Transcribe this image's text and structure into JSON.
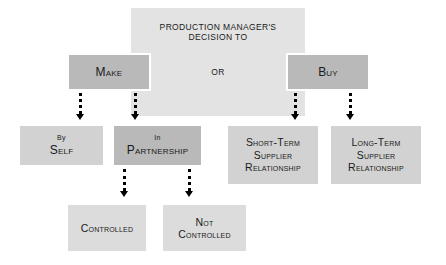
{
  "diagram": {
    "title_lines": [
      "PRODUCTION MANAGER'S",
      "DECISION TO"
    ],
    "connector_label": "OR",
    "colors": {
      "background": "#ffffff",
      "header_box": "#e3e3e3",
      "decision_box": "#b9b9b9",
      "option_box": "#d2d2d2",
      "outcome_box": "#dcdcdc",
      "text": "#1a1a1a",
      "arrow": "#000000",
      "box_outline": "#ffffff"
    },
    "nodes": {
      "header": {
        "line1": "PRODUCTION MANAGER'S",
        "line2": "DECISION TO"
      },
      "make": {
        "label": "Make"
      },
      "buy": {
        "label": "Buy"
      },
      "by_self": {
        "line1": "By",
        "line2": "Self"
      },
      "in_partnership": {
        "line1": "In",
        "line2": "Partnership"
      },
      "short_term": {
        "line1": "Short-Term",
        "line2": "Supplier",
        "line3": "Relationship"
      },
      "long_term": {
        "line1": "Long-Term",
        "line2": "Supplier",
        "line3": "Relationship"
      },
      "controlled": {
        "label": "Controlled"
      },
      "not_controlled": {
        "line1": "Not",
        "line2": "Controlled"
      }
    },
    "arrows": [
      {
        "name": "make-to-by-self",
        "from": "make",
        "to": "by_self"
      },
      {
        "name": "make-to-in-partnership",
        "from": "make",
        "to": "in_partnership"
      },
      {
        "name": "buy-to-short-term",
        "from": "buy",
        "to": "short_term"
      },
      {
        "name": "buy-to-long-term",
        "from": "buy",
        "to": "long_term"
      },
      {
        "name": "in-partnership-to-controlled",
        "from": "in_partnership",
        "to": "controlled"
      },
      {
        "name": "in-partnership-to-not-controlled",
        "from": "in_partnership",
        "to": "not_controlled"
      }
    ]
  }
}
